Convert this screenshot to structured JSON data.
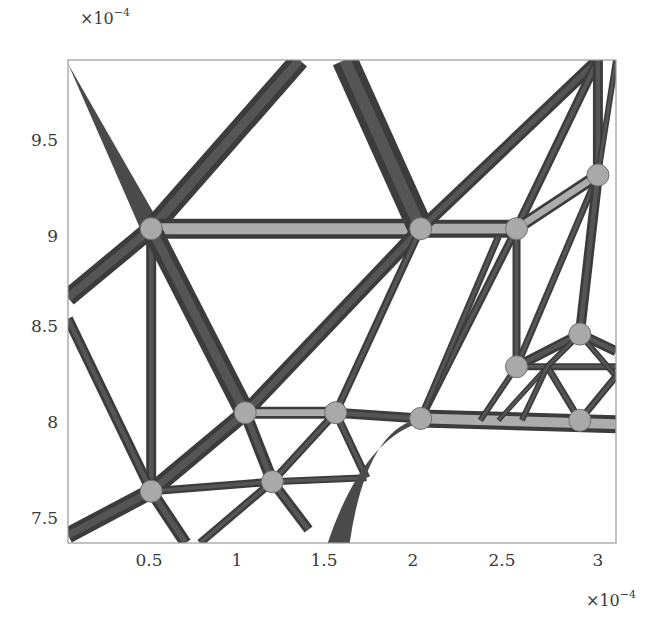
{
  "chart_data": {
    "type": "diagram-plot",
    "title": "",
    "xlabel": "",
    "ylabel": "",
    "x_scale_label": "×10",
    "x_scale_exp": "−4",
    "y_scale_label": "×10",
    "y_scale_exp": "−4",
    "xlim": [
      0.07,
      3.1
    ],
    "ylim": [
      7.38,
      9.9
    ],
    "x_ticks": [
      {
        "label": "0.5",
        "value": 0.5
      },
      {
        "label": "1",
        "value": 1.0
      },
      {
        "label": "1.5",
        "value": 1.5
      },
      {
        "label": "2",
        "value": 2.0
      },
      {
        "label": "2.5",
        "value": 2.5
      },
      {
        "label": "3",
        "value": 3.0
      }
    ],
    "y_ticks": [
      {
        "label": "9.5",
        "value": 9.5
      },
      {
        "label": "9",
        "value": 9.0
      },
      {
        "label": "8.5",
        "value": 8.5
      },
      {
        "label": "8",
        "value": 8.0
      },
      {
        "label": "7.5",
        "value": 7.5
      }
    ],
    "grid": false,
    "legend": null,
    "colors": {
      "member": "#4a4a4a",
      "member_light": "#b8b8b8",
      "frame": "#9a9a9a",
      "background": "#ffffff"
    },
    "members": [
      {
        "from": [
          0.07,
          9.88
        ],
        "to": [
          0.53,
          9.02
        ],
        "width": 10,
        "taper": true
      },
      {
        "from": [
          0.07,
          8.66
        ],
        "to": [
          0.53,
          9.02
        ],
        "width": 18
      },
      {
        "from": [
          0.53,
          9.02
        ],
        "to": [
          1.35,
          9.9
        ],
        "width": 20
      },
      {
        "from": [
          0.53,
          9.02
        ],
        "to": [
          2.02,
          9.02
        ],
        "width": 20,
        "light": true
      },
      {
        "from": [
          2.02,
          9.02
        ],
        "to": [
          2.55,
          9.02
        ],
        "width": 18,
        "light": true
      },
      {
        "from": [
          1.6,
          9.9
        ],
        "to": [
          2.02,
          9.02
        ],
        "width": 26
      },
      {
        "from": [
          2.02,
          9.02
        ],
        "to": [
          3.0,
          9.9
        ],
        "width": 12
      },
      {
        "from": [
          2.55,
          9.02
        ],
        "to": [
          3.0,
          9.9
        ],
        "width": 9
      },
      {
        "from": [
          2.55,
          9.02
        ],
        "to": [
          3.0,
          9.3
        ],
        "width": 12,
        "light": true
      },
      {
        "from": [
          3.0,
          9.3
        ],
        "to": [
          3.0,
          9.9
        ],
        "width": 10
      },
      {
        "from": [
          3.0,
          9.3
        ],
        "to": [
          3.1,
          9.9
        ],
        "width": 6
      },
      {
        "from": [
          0.53,
          9.02
        ],
        "to": [
          0.53,
          7.65
        ],
        "width": 10
      },
      {
        "from": [
          0.53,
          9.02
        ],
        "to": [
          1.05,
          8.06
        ],
        "width": 20
      },
      {
        "from": [
          0.07,
          8.55
        ],
        "to": [
          0.53,
          7.65
        ],
        "width": 10
      },
      {
        "from": [
          0.07,
          7.42
        ],
        "to": [
          0.53,
          7.65
        ],
        "width": 16
      },
      {
        "from": [
          0.53,
          7.65
        ],
        "to": [
          1.05,
          8.06
        ],
        "width": 16
      },
      {
        "from": [
          1.05,
          8.06
        ],
        "to": [
          2.02,
          9.02
        ],
        "width": 14
      },
      {
        "from": [
          1.05,
          8.06
        ],
        "to": [
          1.55,
          8.06
        ],
        "width": 12,
        "light": true
      },
      {
        "from": [
          1.55,
          8.06
        ],
        "to": [
          2.02,
          9.02
        ],
        "width": 8
      },
      {
        "from": [
          1.55,
          8.06
        ],
        "to": [
          2.02,
          8.03
        ],
        "width": 10
      },
      {
        "from": [
          1.05,
          8.06
        ],
        "to": [
          1.2,
          7.7
        ],
        "width": 12
      },
      {
        "from": [
          0.53,
          7.65
        ],
        "to": [
          1.2,
          7.7
        ],
        "width": 8
      },
      {
        "from": [
          1.2,
          7.7
        ],
        "to": [
          1.72,
          7.72
        ],
        "width": 7
      },
      {
        "from": [
          1.2,
          7.7
        ],
        "to": [
          1.55,
          8.06
        ],
        "width": 8
      },
      {
        "from": [
          1.55,
          8.06
        ],
        "to": [
          1.72,
          7.72
        ],
        "width": 8
      },
      {
        "from": [
          1.2,
          7.7
        ],
        "to": [
          1.4,
          7.45
        ],
        "width": 10
      },
      {
        "from": [
          0.53,
          7.65
        ],
        "to": [
          0.72,
          7.38
        ],
        "width": 12
      },
      {
        "from": [
          0.8,
          7.38
        ],
        "to": [
          1.2,
          7.7
        ],
        "width": 8
      },
      {
        "from": [
          2.02,
          8.03
        ],
        "to": [
          2.55,
          9.02
        ],
        "width": 8
      },
      {
        "from": [
          2.02,
          8.03
        ],
        "to": [
          2.45,
          8.98
        ],
        "width": 7
      },
      {
        "from": [
          2.02,
          8.03
        ],
        "to": [
          3.1,
          8.0
        ],
        "width": 18,
        "light": true
      },
      {
        "from": [
          2.55,
          9.02
        ],
        "to": [
          2.55,
          8.3
        ],
        "width": 8
      },
      {
        "from": [
          2.55,
          8.3
        ],
        "to": [
          3.0,
          9.3
        ],
        "width": 7
      },
      {
        "from": [
          2.55,
          8.3
        ],
        "to": [
          2.9,
          8.47
        ],
        "width": 10
      },
      {
        "from": [
          2.9,
          8.47
        ],
        "to": [
          3.0,
          9.3
        ],
        "width": 10
      },
      {
        "from": [
          2.9,
          8.47
        ],
        "to": [
          3.1,
          8.38
        ],
        "width": 10
      },
      {
        "from": [
          2.55,
          8.3
        ],
        "to": [
          3.1,
          8.3
        ],
        "width": 7
      },
      {
        "from": [
          2.9,
          8.47
        ],
        "to": [
          2.72,
          8.3
        ],
        "width": 6
      },
      {
        "from": [
          2.72,
          8.3
        ],
        "to": [
          2.9,
          8.02
        ],
        "width": 7
      },
      {
        "from": [
          2.9,
          8.47
        ],
        "to": [
          3.1,
          8.25
        ],
        "width": 6
      },
      {
        "from": [
          3.1,
          8.25
        ],
        "to": [
          2.9,
          8.02
        ],
        "width": 7
      },
      {
        "from": [
          2.55,
          8.3
        ],
        "to": [
          2.35,
          8.02
        ],
        "width": 6
      },
      {
        "from": [
          2.72,
          8.3
        ],
        "to": [
          2.45,
          8.02
        ],
        "width": 5
      },
      {
        "from": [
          2.72,
          8.3
        ],
        "to": [
          2.58,
          8.02
        ],
        "width": 6
      }
    ],
    "curved_members": [
      {
        "description": "tapered fillet from (2.02,8.03) curving down to (1.55,7.38)",
        "width": 14
      }
    ],
    "nodes": [
      [
        0.53,
        9.02
      ],
      [
        2.02,
        9.02
      ],
      [
        2.55,
        9.02
      ],
      [
        3.0,
        9.3
      ],
      [
        1.05,
        8.06
      ],
      [
        1.55,
        8.06
      ],
      [
        2.02,
        8.03
      ],
      [
        0.53,
        7.65
      ],
      [
        1.2,
        7.7
      ],
      [
        2.55,
        8.3
      ],
      [
        2.9,
        8.47
      ],
      [
        2.9,
        8.02
      ]
    ]
  }
}
